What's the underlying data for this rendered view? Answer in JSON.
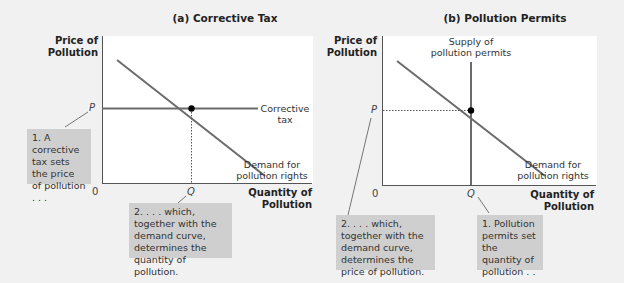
{
  "panels": [
    {
      "title": "(a) Corrective Tax",
      "y_axis_label": [
        "Price of",
        "Pollution"
      ],
      "x_axis_label": [
        "Quantity of",
        "Pollution"
      ],
      "origin": "0",
      "p_tick": "P",
      "q_tick": "Q",
      "curve_labels": {
        "horizontal": [
          "Corrective",
          "tax"
        ],
        "demand": [
          "Demand for",
          "pollution rights"
        ]
      },
      "notes": [
        "1.  A corrective tax sets the price of pollution . . .",
        "2.  . . . which, together with the demand curve, determines the quantity of pollution."
      ]
    },
    {
      "title": "(b) Pollution Permits",
      "y_axis_label": [
        "Price of",
        "Pollution"
      ],
      "x_axis_label": [
        "Quantity of",
        "Pollution"
      ],
      "origin": "0",
      "p_tick": "P",
      "q_tick": "Q",
      "curve_labels": {
        "vertical": [
          "Supply of",
          "pollution permits"
        ],
        "demand": [
          "Demand for",
          "pollution rights"
        ]
      },
      "notes": [
        "2.  . . . which, together with the demand curve, determines the price of pollution.",
        "1.  Pollution permits set the quantity of pollution . . ."
      ]
    }
  ],
  "colors": {
    "background": "#f1f1f1",
    "plot_area": "#ffffff",
    "curve": "#6b6b6b",
    "note_box": "#cfcfcf",
    "point": "#000000"
  }
}
